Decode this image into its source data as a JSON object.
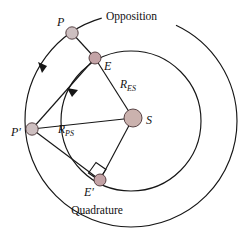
{
  "figure": {
    "background_color": "#ffffff",
    "stroke_color": "#161616",
    "body_fill_color": "#cbb6b8",
    "sun_fill_color": "#cbb2ae"
  },
  "annotations": {
    "opposition_label": "Opposition",
    "quadrature_label": "Quadrature"
  },
  "bodies": [
    {
      "id": "planet-p",
      "label": "P",
      "label_suffix": "",
      "x": 72,
      "y": 33,
      "r": 6.2,
      "fill": "#cdbfc0"
    },
    {
      "id": "earth-e",
      "label": "E",
      "label_suffix": "",
      "x": 95,
      "y": 58,
      "r": 6.0,
      "fill": "#c3a3a6"
    },
    {
      "id": "sun-s",
      "label": "S",
      "label_suffix": "",
      "x": 133,
      "y": 118,
      "r": 9.0,
      "fill": "#cbb2ae"
    },
    {
      "id": "planet-p-prime",
      "label": "P",
      "label_suffix": "′",
      "x": 32,
      "y": 129,
      "r": 6.2,
      "fill": "#cdbfc0"
    },
    {
      "id": "earth-e-prime",
      "label": "E",
      "label_suffix": "′",
      "x": 100,
      "y": 180,
      "r": 6.0,
      "fill": "#c3a3a6"
    }
  ],
  "orbits": [
    {
      "id": "outer-orbit",
      "name": "planet-orbit",
      "cx": 131,
      "cy": 121,
      "r": 106
    },
    {
      "id": "inner-orbit",
      "name": "earth-orbit",
      "cx": 131,
      "cy": 121,
      "r": 70
    }
  ],
  "distance_labels": [
    {
      "id": "r-es",
      "base": "R",
      "sub": "ES",
      "x": 122,
      "y": 84
    },
    {
      "id": "r-ps",
      "base": "R",
      "sub": "PS",
      "x": 62,
      "y": 129
    }
  ],
  "lines": [
    {
      "id": "line-e-s",
      "from": "E",
      "to": "S",
      "x1": 95,
      "y1": 58,
      "x2": 133,
      "y2": 118
    },
    {
      "id": "line-p-e",
      "from": "P",
      "to": "E",
      "x1": 72,
      "y1": 33,
      "x2": 95,
      "y2": 58
    },
    {
      "id": "line-pp-s",
      "from": "P'",
      "to": "S",
      "x1": 32,
      "y1": 129,
      "x2": 133,
      "y2": 118
    },
    {
      "id": "line-pp-ep",
      "from": "P'",
      "to": "E'",
      "x1": 32,
      "y1": 129,
      "x2": 100,
      "y2": 180
    },
    {
      "id": "line-ep-s",
      "from": "E'",
      "to": "S",
      "x1": 100,
      "y1": 180,
      "x2": 133,
      "y2": 118
    },
    {
      "id": "line-e-pp",
      "from": "E",
      "to": "P'",
      "x1": 95,
      "y1": 58,
      "x2": 32,
      "y2": 129
    }
  ],
  "direction_arrows": [
    {
      "id": "outer-orbit-arrow",
      "orbit": "outer-orbit",
      "direction": "counterclockwise"
    },
    {
      "id": "inner-orbit-arrow",
      "orbit": "inner-orbit",
      "direction": "counterclockwise"
    }
  ],
  "right_angle": {
    "id": "quadrature-right-angle",
    "vertex_body": "E'",
    "marker": "square"
  }
}
